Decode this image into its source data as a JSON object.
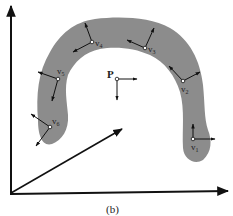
{
  "figure": {
    "caption": "(b)",
    "shape_color": "#8c8c8c",
    "line_color": "#111111",
    "point_label": "P",
    "vertices": [
      {
        "id": "v1",
        "label": "v",
        "sub": "1"
      },
      {
        "id": "v2",
        "label": "v",
        "sub": "2"
      },
      {
        "id": "v3",
        "label": "v",
        "sub": "3"
      },
      {
        "id": "v4",
        "label": "v",
        "sub": "4"
      },
      {
        "id": "v5",
        "label": "v",
        "sub": "5"
      },
      {
        "id": "v6",
        "label": "v",
        "sub": "6"
      }
    ],
    "axes": [
      "y-axis",
      "x-axis",
      "z-axis"
    ]
  }
}
